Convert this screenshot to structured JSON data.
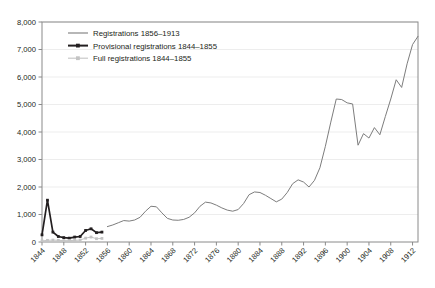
{
  "chart_data": {
    "type": "line",
    "title": "",
    "subtitle": "",
    "xlabel": "",
    "ylabel": "",
    "xlim": [
      1844,
      1913
    ],
    "ylim": [
      0,
      8000
    ],
    "grid": true,
    "legend_position": "top-left",
    "y_ticks": [
      "0",
      "1,000",
      "2,000",
      "3,000",
      "4,000",
      "5,000",
      "6,000",
      "7,000",
      "8,000"
    ],
    "y_tick_values": [
      0,
      1000,
      2000,
      3000,
      4000,
      5000,
      6000,
      7000,
      8000
    ],
    "x_ticks": [
      "1844",
      "1848",
      "1852",
      "1856",
      "1860",
      "1864",
      "1868",
      "1872",
      "1876",
      "1880",
      "1884",
      "1888",
      "1892",
      "1896",
      "1900",
      "1904",
      "1908",
      "1912"
    ],
    "x_tick_values": [
      1844,
      1848,
      1852,
      1856,
      1860,
      1864,
      1868,
      1872,
      1876,
      1880,
      1884,
      1888,
      1892,
      1896,
      1900,
      1904,
      1908,
      1912
    ],
    "series": [
      {
        "name": "Registrations 1856–1913",
        "color": "#7d7d7d",
        "marker": "none",
        "x": [
          1856,
          1857,
          1858,
          1859,
          1860,
          1861,
          1862,
          1863,
          1864,
          1865,
          1866,
          1867,
          1868,
          1869,
          1870,
          1871,
          1872,
          1873,
          1874,
          1875,
          1876,
          1877,
          1878,
          1879,
          1880,
          1881,
          1882,
          1883,
          1884,
          1885,
          1886,
          1887,
          1888,
          1889,
          1890,
          1891,
          1892,
          1893,
          1894,
          1895,
          1896,
          1897,
          1898,
          1899,
          1900,
          1901,
          1902,
          1903,
          1904,
          1905,
          1906,
          1907,
          1908,
          1909,
          1910,
          1911,
          1912,
          1913
        ],
        "y": [
          560,
          620,
          700,
          780,
          760,
          800,
          900,
          1120,
          1300,
          1280,
          1060,
          860,
          800,
          790,
          820,
          900,
          1060,
          1300,
          1450,
          1420,
          1340,
          1240,
          1160,
          1120,
          1180,
          1400,
          1720,
          1820,
          1800,
          1700,
          1580,
          1460,
          1560,
          1800,
          2120,
          2260,
          2180,
          2000,
          2240,
          2700,
          3480,
          4360,
          5200,
          5180,
          5060,
          5020,
          3520,
          3940,
          3780,
          4160,
          3900,
          4560,
          5200,
          5900,
          5620,
          6480,
          7180,
          7480
        ]
      },
      {
        "name": "Provisional registrations 1844–1855",
        "color": "#231f20",
        "marker": "square",
        "x": [
          1844,
          1845,
          1846,
          1847,
          1848,
          1849,
          1850,
          1851,
          1852,
          1853,
          1854,
          1855
        ],
        "y": [
          260,
          1520,
          360,
          200,
          160,
          140,
          180,
          200,
          420,
          480,
          340,
          360
        ]
      },
      {
        "name": "Full registrations 1844–1855",
        "color": "#c4c4c4",
        "marker": "square",
        "x": [
          1844,
          1845,
          1846,
          1847,
          1848,
          1849,
          1850,
          1851,
          1852,
          1853,
          1854,
          1855
        ],
        "y": [
          40,
          60,
          70,
          60,
          50,
          50,
          60,
          70,
          140,
          180,
          120,
          130
        ]
      }
    ]
  }
}
